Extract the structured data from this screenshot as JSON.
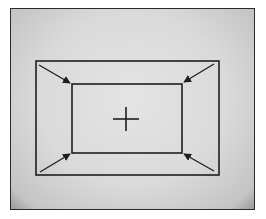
{
  "diagram": {
    "colors": {
      "line": "#1e1e1e",
      "background": "#dcdcdc",
      "frame": "#2a2a2a"
    },
    "outer_rect": {
      "x": 36,
      "y": 61,
      "w": 183,
      "h": 114
    },
    "inner_rect": {
      "x": 72,
      "y": 84,
      "w": 110,
      "h": 69
    },
    "crosshair": {
      "cx": 126,
      "cy": 119,
      "size": 13
    },
    "arrows": [
      {
        "name": "top-left",
        "from": [
          39,
          65
        ],
        "to": [
          70,
          83
        ]
      },
      {
        "name": "top-right",
        "from": [
          214,
          64
        ],
        "to": [
          184,
          82
        ]
      },
      {
        "name": "bottom-left",
        "from": [
          40,
          172
        ],
        "to": [
          70,
          154
        ]
      },
      {
        "name": "bottom-right",
        "from": [
          214,
          171
        ],
        "to": [
          184,
          154
        ]
      }
    ]
  }
}
